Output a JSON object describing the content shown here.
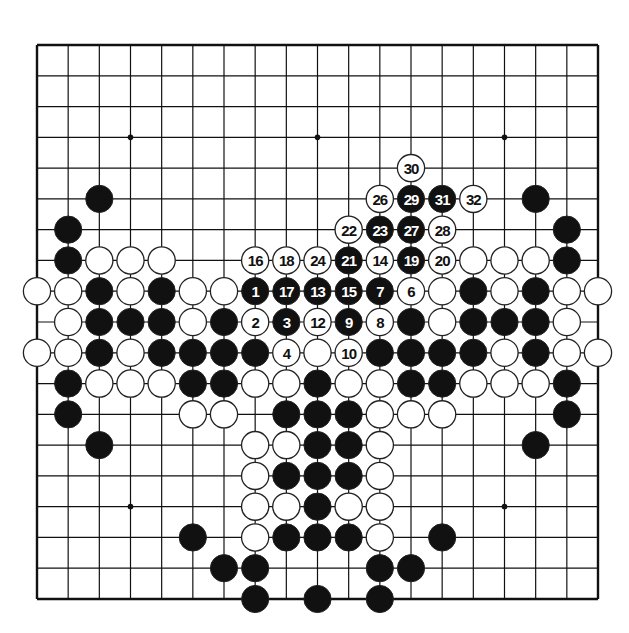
{
  "diagram": {
    "type": "go-board",
    "size": 19,
    "star_points": [
      [
        3,
        3
      ],
      [
        3,
        9
      ],
      [
        3,
        15
      ],
      [
        9,
        3
      ],
      [
        9,
        9
      ],
      [
        9,
        15
      ],
      [
        15,
        3
      ],
      [
        15,
        9
      ],
      [
        15,
        15
      ]
    ],
    "colors": {
      "black": "#111111",
      "white": "#ffffff",
      "line": "#111111"
    },
    "stones": [
      {
        "row": 4,
        "col": 12,
        "color": "W",
        "label": "30"
      },
      {
        "row": 5,
        "col": 2,
        "color": "B"
      },
      {
        "row": 5,
        "col": 11,
        "color": "W",
        "label": "26"
      },
      {
        "row": 5,
        "col": 12,
        "color": "B",
        "label": "29"
      },
      {
        "row": 5,
        "col": 13,
        "color": "B",
        "label": "31"
      },
      {
        "row": 5,
        "col": 14,
        "color": "W",
        "label": "32"
      },
      {
        "row": 5,
        "col": 16,
        "color": "B"
      },
      {
        "row": 6,
        "col": 1,
        "color": "B"
      },
      {
        "row": 6,
        "col": 10,
        "color": "W",
        "label": "22"
      },
      {
        "row": 6,
        "col": 11,
        "color": "B",
        "label": "23"
      },
      {
        "row": 6,
        "col": 12,
        "color": "B",
        "label": "27"
      },
      {
        "row": 6,
        "col": 13,
        "color": "W",
        "label": "28"
      },
      {
        "row": 6,
        "col": 17,
        "color": "B"
      },
      {
        "row": 7,
        "col": 1,
        "color": "B"
      },
      {
        "row": 7,
        "col": 2,
        "color": "W"
      },
      {
        "row": 7,
        "col": 3,
        "color": "W"
      },
      {
        "row": 7,
        "col": 4,
        "color": "W"
      },
      {
        "row": 7,
        "col": 7,
        "color": "W",
        "label": "16"
      },
      {
        "row": 7,
        "col": 8,
        "color": "W",
        "label": "18"
      },
      {
        "row": 7,
        "col": 9,
        "color": "W",
        "label": "24"
      },
      {
        "row": 7,
        "col": 10,
        "color": "B",
        "label": "21"
      },
      {
        "row": 7,
        "col": 11,
        "color": "W",
        "label": "14"
      },
      {
        "row": 7,
        "col": 12,
        "color": "B",
        "label": "19"
      },
      {
        "row": 7,
        "col": 13,
        "color": "W",
        "label": "20"
      },
      {
        "row": 7,
        "col": 14,
        "color": "W"
      },
      {
        "row": 7,
        "col": 15,
        "color": "W"
      },
      {
        "row": 7,
        "col": 16,
        "color": "W"
      },
      {
        "row": 7,
        "col": 17,
        "color": "B"
      },
      {
        "row": 8,
        "col": 0,
        "color": "W"
      },
      {
        "row": 8,
        "col": 1,
        "color": "W"
      },
      {
        "row": 8,
        "col": 2,
        "color": "B"
      },
      {
        "row": 8,
        "col": 3,
        "color": "W"
      },
      {
        "row": 8,
        "col": 4,
        "color": "B"
      },
      {
        "row": 8,
        "col": 5,
        "color": "W"
      },
      {
        "row": 8,
        "col": 6,
        "color": "W"
      },
      {
        "row": 8,
        "col": 7,
        "color": "B",
        "label": "1"
      },
      {
        "row": 8,
        "col": 8,
        "color": "B",
        "label": "17"
      },
      {
        "row": 8,
        "col": 9,
        "color": "B",
        "label": "13"
      },
      {
        "row": 8,
        "col": 10,
        "color": "B",
        "label": "15"
      },
      {
        "row": 8,
        "col": 11,
        "color": "B",
        "label": "7"
      },
      {
        "row": 8,
        "col": 12,
        "color": "W",
        "label": "6"
      },
      {
        "row": 8,
        "col": 13,
        "color": "W"
      },
      {
        "row": 8,
        "col": 14,
        "color": "B"
      },
      {
        "row": 8,
        "col": 15,
        "color": "W"
      },
      {
        "row": 8,
        "col": 16,
        "color": "B"
      },
      {
        "row": 8,
        "col": 17,
        "color": "W"
      },
      {
        "row": 8,
        "col": 18,
        "color": "W"
      },
      {
        "row": 9,
        "col": 1,
        "color": "W"
      },
      {
        "row": 9,
        "col": 2,
        "color": "B"
      },
      {
        "row": 9,
        "col": 3,
        "color": "B"
      },
      {
        "row": 9,
        "col": 4,
        "color": "B"
      },
      {
        "row": 9,
        "col": 5,
        "color": "W"
      },
      {
        "row": 9,
        "col": 6,
        "color": "B"
      },
      {
        "row": 9,
        "col": 7,
        "color": "W",
        "label": "2"
      },
      {
        "row": 9,
        "col": 8,
        "color": "B",
        "label": "3"
      },
      {
        "row": 9,
        "col": 9,
        "color": "W",
        "label": "12"
      },
      {
        "row": 9,
        "col": 10,
        "color": "B",
        "label": "9"
      },
      {
        "row": 9,
        "col": 11,
        "color": "W",
        "label": "8"
      },
      {
        "row": 9,
        "col": 12,
        "color": "B"
      },
      {
        "row": 9,
        "col": 13,
        "color": "W"
      },
      {
        "row": 9,
        "col": 14,
        "color": "B"
      },
      {
        "row": 9,
        "col": 15,
        "color": "B"
      },
      {
        "row": 9,
        "col": 16,
        "color": "B"
      },
      {
        "row": 9,
        "col": 17,
        "color": "W"
      },
      {
        "row": 10,
        "col": 0,
        "color": "W"
      },
      {
        "row": 10,
        "col": 1,
        "color": "W"
      },
      {
        "row": 10,
        "col": 2,
        "color": "B"
      },
      {
        "row": 10,
        "col": 3,
        "color": "W"
      },
      {
        "row": 10,
        "col": 4,
        "color": "B"
      },
      {
        "row": 10,
        "col": 5,
        "color": "B"
      },
      {
        "row": 10,
        "col": 6,
        "color": "B"
      },
      {
        "row": 10,
        "col": 7,
        "color": "B"
      },
      {
        "row": 10,
        "col": 8,
        "color": "W",
        "label": "4"
      },
      {
        "row": 10,
        "col": 9,
        "color": "W"
      },
      {
        "row": 10,
        "col": 10,
        "color": "W",
        "label": "10"
      },
      {
        "row": 10,
        "col": 11,
        "color": "B"
      },
      {
        "row": 10,
        "col": 12,
        "color": "B"
      },
      {
        "row": 10,
        "col": 13,
        "color": "B"
      },
      {
        "row": 10,
        "col": 14,
        "color": "B"
      },
      {
        "row": 10,
        "col": 15,
        "color": "W"
      },
      {
        "row": 10,
        "col": 16,
        "color": "B"
      },
      {
        "row": 10,
        "col": 17,
        "color": "W"
      },
      {
        "row": 10,
        "col": 18,
        "color": "W"
      },
      {
        "row": 11,
        "col": 1,
        "color": "B"
      },
      {
        "row": 11,
        "col": 2,
        "color": "W"
      },
      {
        "row": 11,
        "col": 3,
        "color": "W"
      },
      {
        "row": 11,
        "col": 4,
        "color": "W"
      },
      {
        "row": 11,
        "col": 5,
        "color": "B"
      },
      {
        "row": 11,
        "col": 6,
        "color": "B"
      },
      {
        "row": 11,
        "col": 7,
        "color": "W"
      },
      {
        "row": 11,
        "col": 8,
        "color": "W"
      },
      {
        "row": 11,
        "col": 9,
        "color": "B"
      },
      {
        "row": 11,
        "col": 10,
        "color": "W"
      },
      {
        "row": 11,
        "col": 11,
        "color": "W"
      },
      {
        "row": 11,
        "col": 12,
        "color": "B"
      },
      {
        "row": 11,
        "col": 13,
        "color": "B"
      },
      {
        "row": 11,
        "col": 14,
        "color": "W"
      },
      {
        "row": 11,
        "col": 15,
        "color": "W"
      },
      {
        "row": 11,
        "col": 16,
        "color": "W"
      },
      {
        "row": 11,
        "col": 17,
        "color": "B"
      },
      {
        "row": 12,
        "col": 1,
        "color": "B"
      },
      {
        "row": 12,
        "col": 5,
        "color": "W"
      },
      {
        "row": 12,
        "col": 6,
        "color": "W"
      },
      {
        "row": 12,
        "col": 8,
        "color": "B"
      },
      {
        "row": 12,
        "col": 9,
        "color": "B"
      },
      {
        "row": 12,
        "col": 10,
        "color": "B"
      },
      {
        "row": 12,
        "col": 11,
        "color": "W"
      },
      {
        "row": 12,
        "col": 12,
        "color": "W"
      },
      {
        "row": 12,
        "col": 13,
        "color": "W"
      },
      {
        "row": 12,
        "col": 17,
        "color": "B"
      },
      {
        "row": 13,
        "col": 2,
        "color": "B"
      },
      {
        "row": 13,
        "col": 7,
        "color": "W"
      },
      {
        "row": 13,
        "col": 8,
        "color": "W"
      },
      {
        "row": 13,
        "col": 9,
        "color": "B"
      },
      {
        "row": 13,
        "col": 10,
        "color": "B"
      },
      {
        "row": 13,
        "col": 11,
        "color": "W"
      },
      {
        "row": 13,
        "col": 16,
        "color": "B"
      },
      {
        "row": 14,
        "col": 7,
        "color": "W"
      },
      {
        "row": 14,
        "col": 8,
        "color": "B"
      },
      {
        "row": 14,
        "col": 9,
        "color": "B"
      },
      {
        "row": 14,
        "col": 10,
        "color": "B"
      },
      {
        "row": 14,
        "col": 11,
        "color": "W"
      },
      {
        "row": 15,
        "col": 7,
        "color": "W"
      },
      {
        "row": 15,
        "col": 8,
        "color": "W"
      },
      {
        "row": 15,
        "col": 9,
        "color": "B"
      },
      {
        "row": 15,
        "col": 10,
        "color": "W"
      },
      {
        "row": 15,
        "col": 11,
        "color": "W"
      },
      {
        "row": 16,
        "col": 5,
        "color": "B"
      },
      {
        "row": 16,
        "col": 7,
        "color": "W"
      },
      {
        "row": 16,
        "col": 8,
        "color": "B"
      },
      {
        "row": 16,
        "col": 9,
        "color": "B"
      },
      {
        "row": 16,
        "col": 10,
        "color": "B"
      },
      {
        "row": 16,
        "col": 11,
        "color": "W"
      },
      {
        "row": 16,
        "col": 13,
        "color": "B"
      },
      {
        "row": 17,
        "col": 6,
        "color": "B"
      },
      {
        "row": 17,
        "col": 7,
        "color": "B"
      },
      {
        "row": 17,
        "col": 11,
        "color": "B"
      },
      {
        "row": 17,
        "col": 12,
        "color": "B"
      },
      {
        "row": 18,
        "col": 7,
        "color": "B"
      },
      {
        "row": 18,
        "col": 9,
        "color": "B"
      },
      {
        "row": 18,
        "col": 11,
        "color": "B"
      }
    ]
  }
}
